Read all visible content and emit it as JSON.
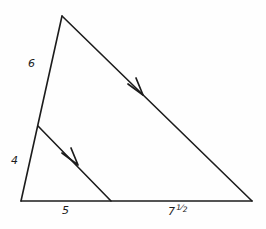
{
  "figure": {
    "background_color": "#fefefe",
    "stroke_color": "#1c1c1c",
    "labels": {
      "upper_left_side": "6",
      "lower_left_side": "4",
      "base_left_segment": "5",
      "base_right_segment_whole": "7",
      "base_right_segment_numerator": "1",
      "base_right_segment_slash": "⁄",
      "base_right_segment_denominator": "2",
      "base_right_segment_full": "7 1/2"
    },
    "geometry": {
      "apex": {
        "x": 62,
        "y": 16
      },
      "bottom_left": {
        "x": 21,
        "y": 201
      },
      "bottom_right": {
        "x": 252,
        "y": 201
      },
      "left_side_division_point": {
        "x": 38,
        "y": 126
      },
      "base_division_point": {
        "x": 111,
        "y": 201
      }
    },
    "markers": {
      "hypotenuse_arrow": {
        "x": 140,
        "y": 90,
        "direction": "down-right"
      },
      "cevian_arrow": {
        "x": 74,
        "y": 160,
        "direction": "down-right"
      }
    }
  }
}
